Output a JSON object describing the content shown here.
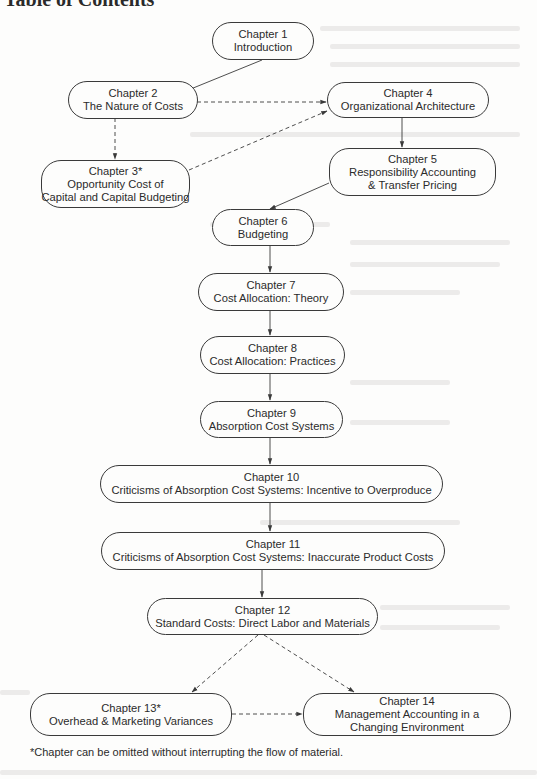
{
  "page": {
    "heading": "Table of Contents",
    "footnote": "*Chapter can be omitted without interrupting the flow of material."
  },
  "chapters": [
    {
      "id": "ch1",
      "number": "Chapter 1",
      "title_lines": [
        "Introduction"
      ],
      "optional": false
    },
    {
      "id": "ch2",
      "number": "Chapter 2",
      "title_lines": [
        "The Nature of Costs"
      ],
      "optional": false
    },
    {
      "id": "ch3",
      "number": "Chapter 3*",
      "title_lines": [
        "Opportunity Cost of",
        "Capital and Capital Budgeting"
      ],
      "optional": true
    },
    {
      "id": "ch4",
      "number": "Chapter 4",
      "title_lines": [
        "Organizational Architecture"
      ],
      "optional": false
    },
    {
      "id": "ch5",
      "number": "Chapter 5",
      "title_lines": [
        "Responsibility Accounting",
        "& Transfer Pricing"
      ],
      "optional": false
    },
    {
      "id": "ch6",
      "number": "Chapter 6",
      "title_lines": [
        "Budgeting"
      ],
      "optional": false
    },
    {
      "id": "ch7",
      "number": "Chapter 7",
      "title_lines": [
        "Cost Allocation: Theory"
      ],
      "optional": false
    },
    {
      "id": "ch8",
      "number": "Chapter 8",
      "title_lines": [
        "Cost Allocation: Practices"
      ],
      "optional": false
    },
    {
      "id": "ch9",
      "number": "Chapter 9",
      "title_lines": [
        "Absorption Cost Systems"
      ],
      "optional": false
    },
    {
      "id": "ch10",
      "number": "Chapter 10",
      "title_lines": [
        "Criticisms of Absorption Cost Systems: Incentive to Overproduce"
      ],
      "optional": false
    },
    {
      "id": "ch11",
      "number": "Chapter 11",
      "title_lines": [
        "Criticisms of Absorption Cost Systems: Inaccurate Product Costs"
      ],
      "optional": false
    },
    {
      "id": "ch12",
      "number": "Chapter 12",
      "title_lines": [
        "Standard Costs: Direct Labor and Materials"
      ],
      "optional": false
    },
    {
      "id": "ch13",
      "number": "Chapter 13*",
      "title_lines": [
        "Overhead & Marketing Variances"
      ],
      "optional": true
    },
    {
      "id": "ch14",
      "number": "Chapter 14",
      "title_lines": [
        "Management Accounting in a",
        "Changing Environment"
      ],
      "optional": false
    }
  ],
  "edges": [
    {
      "from": "ch1",
      "to": "ch2",
      "style": "solid"
    },
    {
      "from": "ch2",
      "to": "ch4",
      "style": "dashed"
    },
    {
      "from": "ch2",
      "to": "ch3",
      "style": "dashed"
    },
    {
      "from": "ch3",
      "to": "ch4",
      "style": "dashed"
    },
    {
      "from": "ch4",
      "to": "ch5",
      "style": "solid"
    },
    {
      "from": "ch5",
      "to": "ch6",
      "style": "solid"
    },
    {
      "from": "ch6",
      "to": "ch7",
      "style": "solid"
    },
    {
      "from": "ch7",
      "to": "ch8",
      "style": "solid"
    },
    {
      "from": "ch8",
      "to": "ch9",
      "style": "solid"
    },
    {
      "from": "ch9",
      "to": "ch10",
      "style": "solid"
    },
    {
      "from": "ch10",
      "to": "ch11",
      "style": "solid"
    },
    {
      "from": "ch11",
      "to": "ch12",
      "style": "solid"
    },
    {
      "from": "ch12",
      "to": "ch13",
      "style": "dashed"
    },
    {
      "from": "ch12",
      "to": "ch14",
      "style": "dashed"
    },
    {
      "from": "ch13",
      "to": "ch14",
      "style": "dashed"
    }
  ],
  "colors": {
    "line": "#3a3a3a",
    "text": "#2b2b2b",
    "background": "#fdfdfc"
  }
}
